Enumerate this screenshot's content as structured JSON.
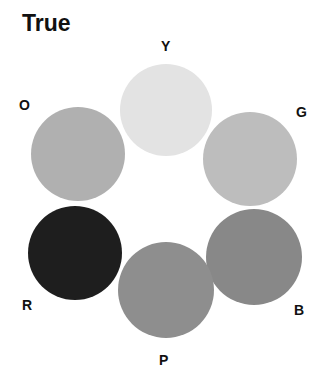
{
  "title": "True",
  "circles": [
    {
      "label": "Y",
      "color": "#e3e3e3",
      "cx": 166,
      "cy": 110,
      "r": 46,
      "label_x": 161,
      "label_y": 38
    },
    {
      "label": "G",
      "color": "#bdbdbd",
      "cx": 250,
      "cy": 159,
      "r": 47,
      "label_x": 296,
      "label_y": 104
    },
    {
      "label": "B",
      "color": "#888888",
      "cx": 254,
      "cy": 257,
      "r": 48,
      "label_x": 294,
      "label_y": 302
    },
    {
      "label": "P",
      "color": "#8e8e8e",
      "cx": 166,
      "cy": 290,
      "r": 48,
      "label_x": 159,
      "label_y": 352
    },
    {
      "label": "R",
      "color": "#1e1e1e",
      "cx": 75,
      "cy": 253,
      "r": 47,
      "label_x": 22,
      "label_y": 297
    },
    {
      "label": "O",
      "color": "#b0b0b0",
      "cx": 78,
      "cy": 154,
      "r": 47,
      "label_x": 19,
      "label_y": 97
    }
  ]
}
